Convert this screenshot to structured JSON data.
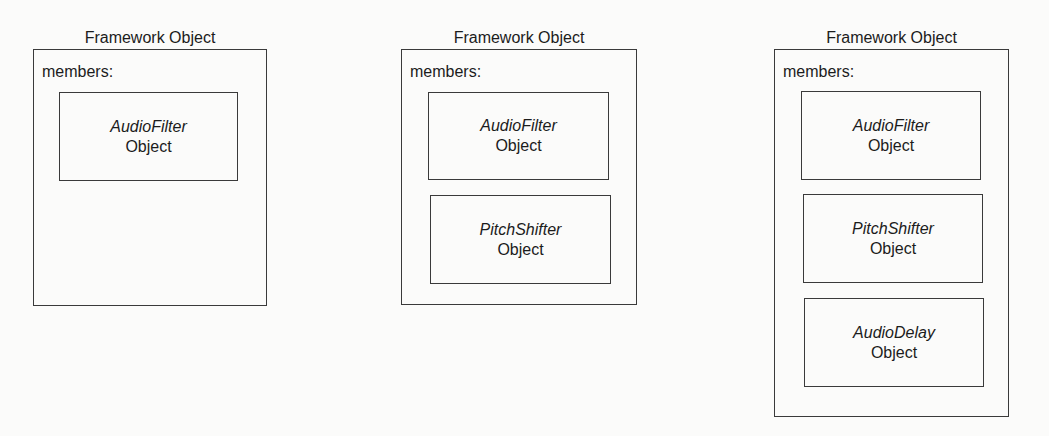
{
  "diagrams": [
    {
      "title": "Framework Object",
      "members_label": "members:",
      "members": [
        {
          "class_name": "AudioFilter",
          "kind": "Object"
        }
      ]
    },
    {
      "title": "Framework Object",
      "members_label": "members:",
      "members": [
        {
          "class_name": "AudioFilter",
          "kind": "Object"
        },
        {
          "class_name": "PitchShifter",
          "kind": "Object"
        }
      ]
    },
    {
      "title": "Framework Object",
      "members_label": "members:",
      "members": [
        {
          "class_name": "AudioFilter",
          "kind": "Object"
        },
        {
          "class_name": "PitchShifter",
          "kind": "Object"
        },
        {
          "class_name": "AudioDelay",
          "kind": "Object"
        }
      ]
    }
  ],
  "colors": {
    "background": "#fbfbfa",
    "line": "#3a3a3a",
    "text": "#1c1c1c"
  }
}
